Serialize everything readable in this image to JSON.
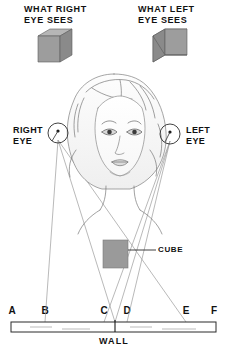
{
  "figure": {
    "kind": "binocular-vision-stereopsis-diagram",
    "background_color": "#ffffff",
    "ink_color": "#111111",
    "ray_color": "#8d8d8d",
    "cube_face_color": "#9a9a9a",
    "cube_top_color": "#b4b4b4",
    "cube_side_color": "#7e7e7e",
    "outline_color": "#4a4a4a"
  },
  "titles": {
    "right_view": "WHAT RIGHT\nEYE SEES",
    "left_view": "WHAT LEFT\nEYE SEES"
  },
  "eye_labels": {
    "right": "RIGHT\nEYE",
    "left": "LEFT\nEYE"
  },
  "annotations": {
    "cube": "CUBE",
    "wall": "WALL"
  },
  "wall_marks": [
    {
      "letter": "A",
      "x": 12
    },
    {
      "letter": "B",
      "x": 45
    },
    {
      "letter": "C",
      "x": 104
    },
    {
      "letter": "D",
      "x": 127
    },
    {
      "letter": "E",
      "x": 186
    },
    {
      "letter": "F",
      "x": 214
    }
  ],
  "top_cubes": [
    {
      "id": "right-eye-view-cube",
      "visible_side_face": "right",
      "x": 38,
      "y": 29,
      "size": 30
    },
    {
      "id": "left-eye-view-cube",
      "visible_side_face": "left",
      "x": 153,
      "y": 29,
      "size": 30
    }
  ],
  "eyes": [
    {
      "id": "right-eye",
      "cx": 58,
      "cy": 133,
      "r": 10
    },
    {
      "id": "left-eye",
      "cx": 170,
      "cy": 134,
      "r": 10
    }
  ],
  "scene_cube": {
    "x": 103,
    "y": 240,
    "width": 25,
    "height": 28
  },
  "wall": {
    "x1": 11,
    "x2": 216,
    "y_top": 322,
    "y_bottom": 332,
    "center_tick_x": 115
  }
}
